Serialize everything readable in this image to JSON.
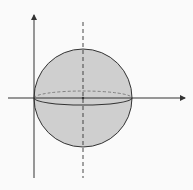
{
  "diagram": {
    "type": "sphere-on-axes",
    "colors": {
      "background": "#fafafa",
      "sphere_fill": "#cfcfcf",
      "stroke": "#333333",
      "hidden_equator": "#777777"
    },
    "axes": {
      "vertical": {
        "x": 34,
        "y_top": 15,
        "y_bottom": 178,
        "arrow": "up"
      },
      "horizontal": {
        "y": 98,
        "x_left": 8,
        "x_right": 185,
        "arrow": "right"
      }
    },
    "sphere": {
      "cx": 83,
      "cy": 98,
      "r": 49
    },
    "center_line": {
      "x": 83,
      "y_top": 22,
      "y_bottom": 178,
      "style": "dashed"
    },
    "equator": {
      "front_ry": 7,
      "back_ry": 7
    }
  }
}
